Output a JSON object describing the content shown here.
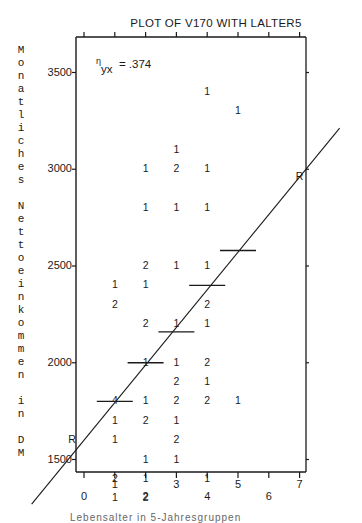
{
  "chart_data": {
    "type": "scatter",
    "title": "PLOT OF V170 WITH LALTER5",
    "ylabel": "Monatliches Nettoeinkommen in DM",
    "xlabel": "Lebensalter in 5-Jahresgruppen",
    "annotation": "η_yx = .374",
    "eta_symbol": "η",
    "eta_sub": "yx",
    "eta_value": "= .374",
    "yticks": [
      "1500",
      "2000",
      "2500",
      "3000",
      "3500",
      "4000"
    ],
    "ytick_values": [
      1500,
      2000,
      2500,
      3000,
      3500,
      4000
    ],
    "xticks_lower": [
      "0",
      "2",
      "4",
      "6"
    ],
    "xticks_upper": [
      "1",
      "3",
      "5",
      "7"
    ],
    "xlim": [
      -0.2,
      7.2
    ],
    "ylim": [
      800,
      4450
    ],
    "grid": false,
    "legend": "none",
    "point_marker": "count of observations at position",
    "regression_line_endpoint_label": "R",
    "points": [
      {
        "x": 4,
        "y": 4300,
        "n": "1"
      },
      {
        "x": 4,
        "y": 3400,
        "n": "1"
      },
      {
        "x": 5,
        "y": 3300,
        "n": "1"
      },
      {
        "x": 3,
        "y": 3100,
        "n": "1"
      },
      {
        "x": 2,
        "y": 3000,
        "n": "1"
      },
      {
        "x": 3,
        "y": 3000,
        "n": "2"
      },
      {
        "x": 4,
        "y": 3000,
        "n": "1"
      },
      {
        "x": 2,
        "y": 2800,
        "n": "1"
      },
      {
        "x": 3,
        "y": 2800,
        "n": "1"
      },
      {
        "x": 4,
        "y": 2800,
        "n": "1"
      },
      {
        "x": 2,
        "y": 2500,
        "n": "2"
      },
      {
        "x": 3,
        "y": 2500,
        "n": "1"
      },
      {
        "x": 4,
        "y": 2500,
        "n": "1"
      },
      {
        "x": 1,
        "y": 2400,
        "n": "1"
      },
      {
        "x": 2,
        "y": 2400,
        "n": "1"
      },
      {
        "x": 1,
        "y": 2300,
        "n": "2"
      },
      {
        "x": 4,
        "y": 2300,
        "n": "2"
      },
      {
        "x": 2,
        "y": 2200,
        "n": "2"
      },
      {
        "x": 3,
        "y": 2200,
        "n": "1"
      },
      {
        "x": 4,
        "y": 2200,
        "n": "1"
      },
      {
        "x": 2,
        "y": 2000,
        "n": "1"
      },
      {
        "x": 3,
        "y": 2000,
        "n": "1"
      },
      {
        "x": 4,
        "y": 2000,
        "n": "2"
      },
      {
        "x": 3,
        "y": 1900,
        "n": "2"
      },
      {
        "x": 4,
        "y": 1900,
        "n": "1"
      },
      {
        "x": 1,
        "y": 1800,
        "n": "4"
      },
      {
        "x": 2,
        "y": 1800,
        "n": "1"
      },
      {
        "x": 3,
        "y": 1800,
        "n": "2"
      },
      {
        "x": 4,
        "y": 1800,
        "n": "2"
      },
      {
        "x": 5,
        "y": 1800,
        "n": "1"
      },
      {
        "x": 1,
        "y": 1700,
        "n": "1"
      },
      {
        "x": 2,
        "y": 1700,
        "n": "2"
      },
      {
        "x": 3,
        "y": 1700,
        "n": "1"
      },
      {
        "x": 1,
        "y": 1600,
        "n": "1"
      },
      {
        "x": 3,
        "y": 1600,
        "n": "2"
      },
      {
        "x": 2,
        "y": 1500,
        "n": "1"
      },
      {
        "x": 3,
        "y": 1500,
        "n": "1"
      },
      {
        "x": 1,
        "y": 1400,
        "n": "2"
      },
      {
        "x": 2,
        "y": 1400,
        "n": "1"
      },
      {
        "x": 4,
        "y": 1400,
        "n": "1"
      },
      {
        "x": 1,
        "y": 1300,
        "n": "1"
      },
      {
        "x": 2,
        "y": 1300,
        "n": "2"
      }
    ],
    "group_means": [
      {
        "x": 1,
        "y": 1800
      },
      {
        "x": 2,
        "y": 2000
      },
      {
        "x": 3,
        "y": 2160
      },
      {
        "x": 4,
        "y": 2400
      },
      {
        "x": 5,
        "y": 2580
      }
    ],
    "regression_line": {
      "x0": 0,
      "y0": 1600,
      "x1": 7,
      "y1": 2960
    }
  }
}
